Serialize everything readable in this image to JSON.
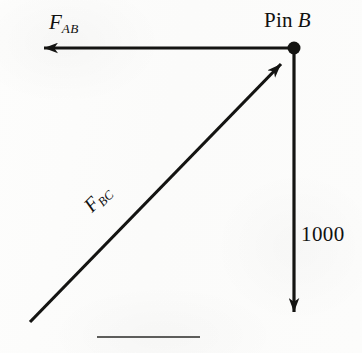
{
  "figure": {
    "kind": "force-vector-diagram",
    "width": 362,
    "height": 353,
    "background_color": "#fcfcfb",
    "ink_color": "#141412"
  },
  "node": {
    "label_prefix": "Pin",
    "label_name": "B",
    "x": 294,
    "y": 48,
    "dot_radius": 6.5
  },
  "vectors": [
    {
      "id": "fab",
      "label_symbol": "F",
      "label_subscript": "AB",
      "from_x": 294,
      "from_y": 48,
      "to_x": 30,
      "to_y": 48,
      "direction": "left",
      "label_x": 49,
      "label_y": 12,
      "rotation_deg": 0
    },
    {
      "id": "fbc",
      "label_symbol": "F",
      "label_subscript": "BC",
      "from_x": 30,
      "from_y": 322,
      "to_x": 290,
      "to_y": 55,
      "direction": "up-right",
      "label_x": 88,
      "label_y": 198,
      "rotation_deg": -45.5
    },
    {
      "id": "load",
      "label_symbol": "1000",
      "label_subscript": "",
      "from_x": 294,
      "from_y": 48,
      "to_x": 294,
      "to_y": 325,
      "direction": "down",
      "label_x": 301,
      "label_y": 224,
      "rotation_deg": 0
    }
  ],
  "rule": {
    "x1": 97,
    "y1": 337,
    "x2": 200,
    "y2": 337
  },
  "labels": {
    "pin": "Pin",
    "pin_name": "B",
    "force_symbol": "F",
    "fab_subscript": "AB",
    "fbc_subscript": "BC",
    "load_value": "1000"
  }
}
